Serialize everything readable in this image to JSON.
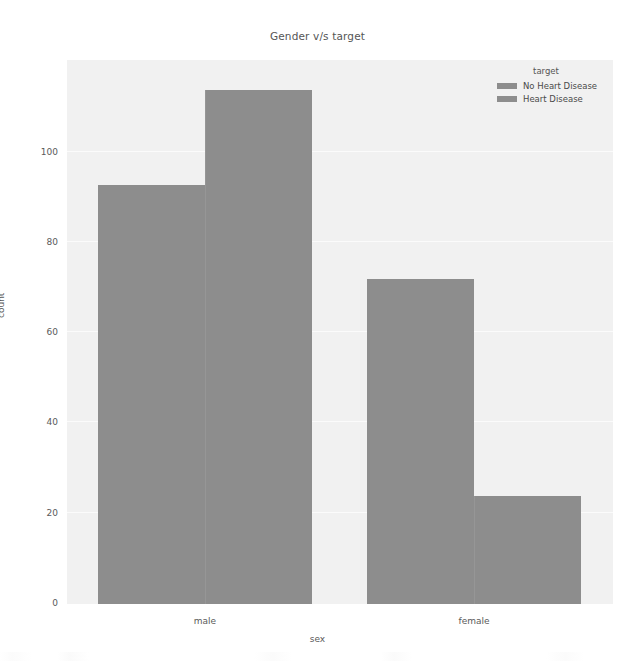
{
  "chart_data": {
    "type": "bar",
    "title": "Gender v/s target",
    "xlabel": "sex",
    "ylabel": "count",
    "categories": [
      "male",
      "female"
    ],
    "series": [
      {
        "name": "No Heart Disease",
        "values": [
          93,
          72
        ],
        "color": "#8d8d8d"
      },
      {
        "name": "Heart Disease",
        "values": [
          114,
          24
        ],
        "color": "#8d8d8d"
      }
    ],
    "legend_title": "target",
    "legend_position": "upper right",
    "ylim": [
      0,
      118
    ],
    "yticks": [
      0,
      20,
      40,
      60,
      80,
      100
    ],
    "ytick_labels": [
      "0",
      "20",
      "40",
      "60",
      "80",
      "100"
    ],
    "grid": false,
    "plot_background": "#f1f1f1",
    "figure_background": "#ffffff",
    "bar_color": "#8d8d8d",
    "text_color": "#555555"
  },
  "axis": {
    "y_tick_0": "0",
    "y_tick_1": "20",
    "y_tick_2": "40",
    "y_tick_3": "60",
    "y_tick_4": "80",
    "y_tick_5": "100",
    "x_tick_0": "male",
    "x_tick_1": "female"
  },
  "legend": {
    "title": "target",
    "item_0": "No Heart Disease",
    "item_1": "Heart Disease"
  }
}
